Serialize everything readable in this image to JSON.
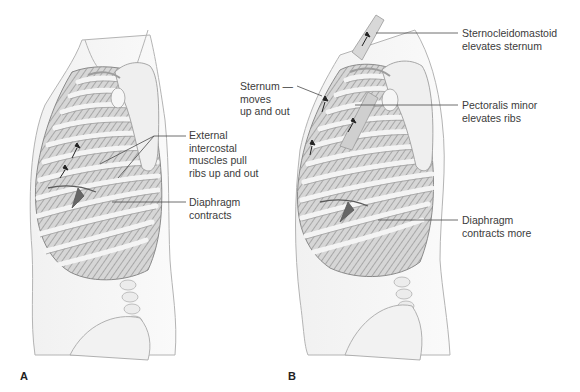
{
  "figure": {
    "panels": [
      {
        "letter": "A",
        "labels": [
          {
            "id": "external-intercostal",
            "text": "External\nintercostal\nmuscles pull\nribs up and out"
          },
          {
            "id": "diaphragm-a",
            "text": "Diaphragm\ncontracts"
          }
        ]
      },
      {
        "letter": "B",
        "labels": [
          {
            "id": "sternum",
            "text": "Sternum —\nmoves\nup and out"
          },
          {
            "id": "sternocleidomastoid",
            "text": "Sternocleidomastoid\nelevates sternum"
          },
          {
            "id": "pectoralis-minor",
            "text": "Pectoralis minor\nelevates ribs"
          },
          {
            "id": "diaphragm-b",
            "text": "Diaphragm\ncontracts more"
          }
        ]
      }
    ],
    "colors": {
      "outline": "#9a9a9a",
      "rib_fill": "#e4e4e4",
      "intercostal": "#8c8c8c",
      "label_text": "#3b3b3b",
      "leader_line": "#4a4a4a",
      "arrow": "#222222"
    }
  }
}
